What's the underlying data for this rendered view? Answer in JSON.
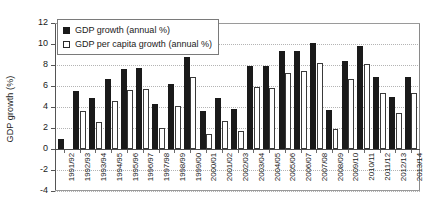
{
  "chart_data": {
    "type": "bar",
    "title": "",
    "xlabel": "",
    "ylabel": "GDP growth (%)",
    "ylim": [
      -4,
      12
    ],
    "ytick_values": [
      12,
      10,
      8,
      6,
      4,
      2,
      0,
      -2,
      -4
    ],
    "ytick_labels": [
      "12",
      "10",
      "8",
      "6",
      "4",
      "2",
      "0",
      "-2",
      "-4"
    ],
    "grid": true,
    "legend_position": "top-left",
    "categories": [
      "1991/92",
      "1992/93",
      "1993/94",
      "1994/95",
      "1995/96",
      "1996/97",
      "1997/98",
      "1998/99",
      "1999/00",
      "2000/01",
      "2001/02",
      "2002/03",
      "2003/04",
      "2004/05",
      "2005/06",
      "2006/07",
      "2007/08",
      "2008/09",
      "2009/10",
      "2010/11",
      "2011/12",
      "2012/13",
      "2013/14"
    ],
    "series": [
      {
        "name": "GDP growth (annual %)",
        "color": "#1a1a1a",
        "values": [
          1.0,
          5.5,
          4.9,
          6.7,
          7.6,
          7.7,
          4.3,
          6.2,
          8.8,
          3.6,
          4.9,
          3.8,
          7.9,
          7.9,
          9.3,
          9.3,
          10.1,
          3.7,
          8.4,
          9.8,
          6.9,
          5.0,
          6.9
        ]
      },
      {
        "name": "GDP per capita growth (annual %)",
        "color": "#ffffff",
        "values": [
          0.0,
          3.6,
          2.6,
          4.6,
          5.6,
          5.7,
          2.0,
          4.1,
          6.9,
          1.4,
          2.7,
          1.7,
          5.9,
          5.8,
          7.2,
          7.4,
          8.2,
          1.9,
          6.7,
          8.1,
          5.3,
          3.4,
          5.3
        ]
      }
    ]
  },
  "legend": {
    "items": [
      {
        "swatch": "dark",
        "label": "GDP growth (annual %)"
      },
      {
        "swatch": "light",
        "label": "GDP per capita growth (annual %)"
      }
    ]
  }
}
